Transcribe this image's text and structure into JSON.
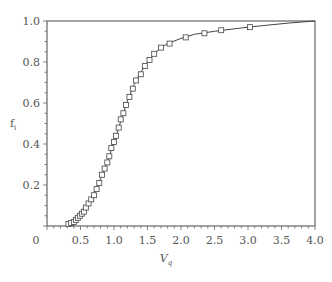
{
  "chart_data": {
    "type": "line",
    "title": "",
    "xlabel": "V",
    "xlabel_subscript": "q",
    "ylabel": "f",
    "ylabel_subscript": "i",
    "xlim": [
      0,
      4.0
    ],
    "ylim": [
      0,
      1.0
    ],
    "grid": false,
    "legend": null,
    "x_ticks": [
      "0",
      "0.5",
      "1.0",
      "1.5",
      "2.0",
      "2.5",
      "3.0",
      "3.5",
      "4.0"
    ],
    "y_ticks": [
      "0.2",
      "0.4",
      "0.6",
      "0.8",
      "1.0"
    ],
    "series": [
      {
        "name": "measured",
        "style": "open-square-markers",
        "x": [
          0.32,
          0.36,
          0.4,
          0.43,
          0.46,
          0.49,
          0.52,
          0.55,
          0.58,
          0.62,
          0.66,
          0.7,
          0.74,
          0.78,
          0.82,
          0.86,
          0.9,
          0.93,
          0.96,
          1.0,
          1.03,
          1.07,
          1.1,
          1.14,
          1.18,
          1.23,
          1.28,
          1.33,
          1.4,
          1.46,
          1.53,
          1.6,
          1.7,
          1.83,
          2.07,
          2.35,
          2.6,
          3.03
        ],
        "y": [
          0.01,
          0.015,
          0.02,
          0.03,
          0.04,
          0.05,
          0.06,
          0.07,
          0.09,
          0.11,
          0.13,
          0.15,
          0.18,
          0.21,
          0.25,
          0.28,
          0.31,
          0.34,
          0.38,
          0.41,
          0.44,
          0.48,
          0.52,
          0.55,
          0.59,
          0.63,
          0.67,
          0.71,
          0.74,
          0.78,
          0.81,
          0.84,
          0.87,
          0.89,
          0.92,
          0.94,
          0.955,
          0.97
        ]
      },
      {
        "name": "fitted curve",
        "style": "solid-line",
        "x": [
          0.3,
          0.4,
          0.5,
          0.6,
          0.7,
          0.8,
          0.9,
          1.0,
          1.1,
          1.2,
          1.3,
          1.4,
          1.5,
          1.6,
          1.7,
          1.8,
          2.0,
          2.2,
          2.5,
          2.8,
          3.0,
          3.3,
          3.6,
          4.0
        ],
        "y": [
          0.005,
          0.02,
          0.05,
          0.1,
          0.15,
          0.23,
          0.31,
          0.41,
          0.51,
          0.61,
          0.69,
          0.75,
          0.8,
          0.84,
          0.87,
          0.89,
          0.915,
          0.935,
          0.95,
          0.962,
          0.97,
          0.98,
          0.99,
          1.0
        ]
      }
    ]
  }
}
